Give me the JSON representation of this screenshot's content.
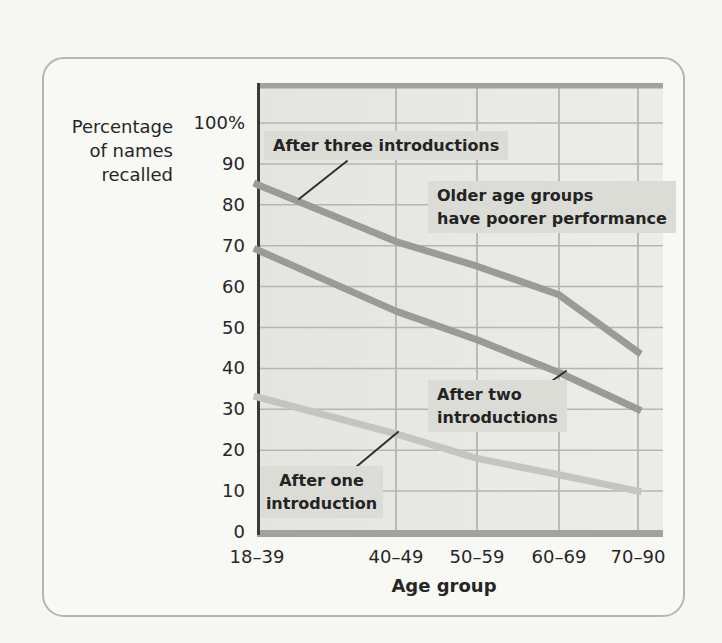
{
  "figure": {
    "y_axis_title": "Percentage\nof names\nrecalled",
    "x_axis_title": "Age group",
    "annotations": {
      "after_three": "After three introductions",
      "older_note": "Older age groups\nhave poorer performance",
      "after_two": "After two\nintroductions",
      "after_one": "After one\nintroduction"
    }
  },
  "colors": {
    "page_bg": "#f6f6f3",
    "card_bg": "#f8f8f5",
    "card_border": "#b5b5b2",
    "plot_bg_left": "#e4e4e0",
    "plot_bg_right": "#ecece8",
    "grid": "#b5b5b1",
    "plot_band": "#a2a29e",
    "axis": "#3a3a3a",
    "text": "#2b2b2b",
    "annotation_bg": "#dcdcd7",
    "line_dark_gray": "#9a9a96",
    "line_light_gray": "#c4c4c0",
    "pointer": "#2f2f2f"
  },
  "chart_data": {
    "type": "line",
    "title": "",
    "xlabel": "Age group",
    "ylabel": "Percentage of names recalled",
    "categories": [
      "18–39",
      "40–49",
      "50–59",
      "60–69",
      "70–90"
    ],
    "series": [
      {
        "name": "After three introductions",
        "values": [
          85,
          71,
          65,
          58,
          44
        ],
        "color": "#9a9a96"
      },
      {
        "name": "After two introductions",
        "values": [
          69,
          54,
          47,
          39,
          30
        ],
        "color": "#9a9a96"
      },
      {
        "name": "After one introduction",
        "values": [
          33,
          24,
          18,
          14,
          10
        ],
        "color": "#c4c4c0"
      }
    ],
    "ylim": [
      0,
      100
    ],
    "ytick_step": 10,
    "yticks": [
      "100%",
      "90",
      "80",
      "70",
      "60",
      "50",
      "40",
      "30",
      "20",
      "10",
      "0"
    ],
    "grid": true,
    "legend_position": "none",
    "annotations": [
      "After three introductions",
      "Older age groups have poorer performance",
      "After two introductions",
      "After one introduction"
    ]
  }
}
